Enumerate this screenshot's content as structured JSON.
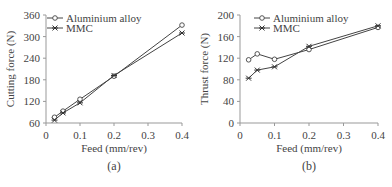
{
  "chart_data": [
    {
      "type": "line",
      "panel_label": "(a)",
      "xlabel": "Feed (mm/rev)",
      "ylabel": "Cutting force (N)",
      "xlim": [
        0,
        0.4
      ],
      "ylim": [
        60,
        360
      ],
      "xticks": [
        "0",
        "0.1",
        "0.2",
        "0.3",
        "0.4"
      ],
      "yticks": [
        "60",
        "120",
        "180",
        "240",
        "300",
        "360"
      ],
      "grid": false,
      "legend_position": "upper left",
      "x": [
        0.025,
        0.05,
        0.1,
        0.2,
        0.4
      ],
      "series": [
        {
          "name": "Aluminium alloy",
          "marker": "circle",
          "values": [
            76,
            93,
            126,
            190,
            332
          ]
        },
        {
          "name": "MMC",
          "marker": "star",
          "values": [
            68,
            88,
            116,
            192,
            310
          ]
        }
      ]
    },
    {
      "type": "line",
      "panel_label": "(b)",
      "xlabel": "Feed (mm/rev)",
      "ylabel": "Thrust force (N)",
      "xlim": [
        0,
        0.4
      ],
      "ylim": [
        0,
        200
      ],
      "xticks": [
        "0",
        "0.1",
        "0.2",
        "0.3",
        "0.4"
      ],
      "yticks": [
        "0",
        "40",
        "80",
        "120",
        "160",
        "200"
      ],
      "grid": false,
      "legend_position": "upper center",
      "x": [
        0.025,
        0.05,
        0.1,
        0.2,
        0.4
      ],
      "series": [
        {
          "name": "Aluminium alloy",
          "marker": "circle",
          "values": [
            117,
            128,
            118,
            136,
            177
          ]
        },
        {
          "name": "MMC",
          "marker": "star",
          "values": [
            83,
            98,
            104,
            142,
            180
          ]
        }
      ]
    }
  ]
}
